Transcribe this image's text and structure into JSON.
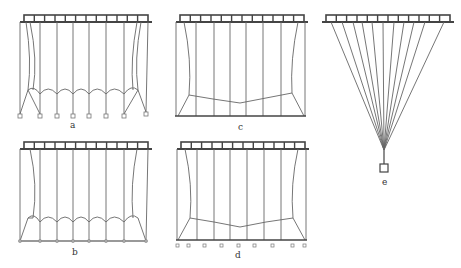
{
  "figure": {
    "panels": [
      {
        "id": "a",
        "label": "a",
        "description": "curtain hanging, free bottom nodes, scalloped mid-line"
      },
      {
        "id": "b",
        "label": "b",
        "description": "curtain hanging, connected bottom nodes, scalloped mid-line"
      },
      {
        "id": "c",
        "label": "c",
        "description": "curtain with flat bottom bar, V-shaped mid-line"
      },
      {
        "id": "d",
        "label": "d",
        "description": "curtain with bottom bar and free nodes, V-shaped mid-line"
      },
      {
        "id": "e",
        "label": "e",
        "description": "fan of strings converging to single weight"
      }
    ],
    "colors": {
      "line": "#555555",
      "bar": "#444444",
      "background": "#ffffff"
    }
  }
}
